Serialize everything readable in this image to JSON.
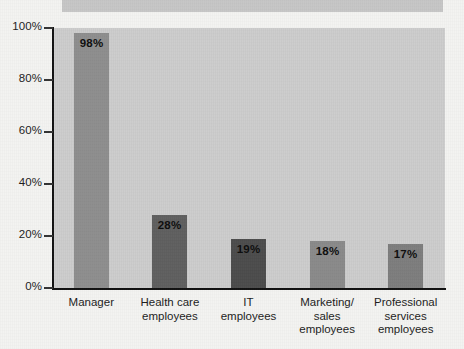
{
  "chart_data": {
    "type": "bar",
    "title": "",
    "xlabel": "",
    "ylabel": "",
    "ylim": [
      0,
      100
    ],
    "grid": false,
    "legend": "none",
    "categories": [
      "Manager",
      "Health care\nemployees",
      "IT\nemployees",
      "Marketing/\nsales\nemployees",
      "Professional\nservices\nemployees"
    ],
    "values": [
      98,
      28,
      19,
      18,
      17
    ],
    "value_labels": [
      "98%",
      "28%",
      "19%",
      "18%",
      "17%"
    ],
    "y_ticks": [
      0,
      20,
      40,
      60,
      80,
      100
    ],
    "y_tick_labels": [
      "0%",
      "20%",
      "40%",
      "60%",
      "80%",
      "100%"
    ],
    "bar_colors": [
      "#8e8e8e",
      "#5f5f5f",
      "#4c4c4c",
      "#8a8a8a",
      "#7d7d7d"
    ]
  },
  "colors": {
    "plot_background": "#cbcbcb",
    "page_background": "#f3f3f1",
    "axis": "#111111",
    "banner": "#c6c6c6"
  },
  "banner": {
    "label": ""
  }
}
